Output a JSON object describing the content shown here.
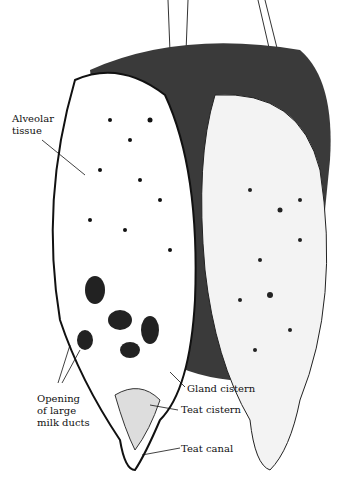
{
  "figure": {
    "labels": {
      "alveolar_tissue": "Alveolar\ntissue",
      "opening_ducts": "Opening\nof large\nmilk ducts",
      "gland_cistern": "Gland cistern",
      "teat_cistern": "Teat cistern",
      "teat_canal": "Teat canal"
    }
  }
}
